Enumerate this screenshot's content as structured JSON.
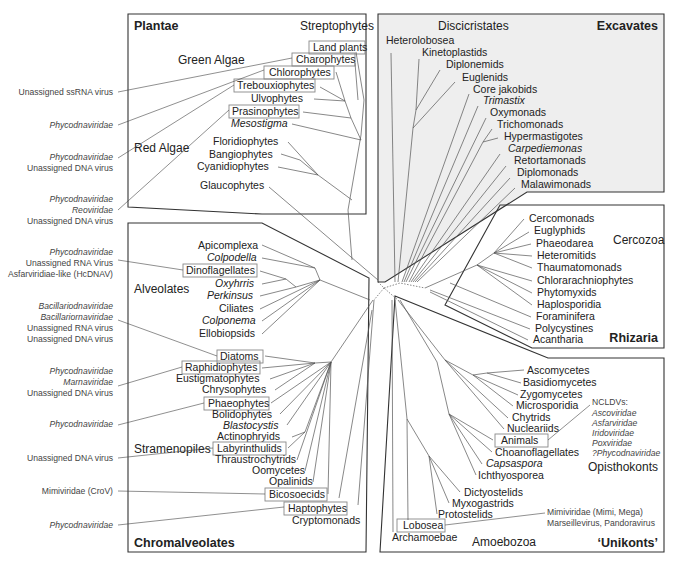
{
  "supergroups": {
    "plantae": "Plantae",
    "excavates": "Excavates",
    "rhizaria": "Rhizaria",
    "chromalveolates": "Chromalveolates",
    "unikonts": "‘Unikonts’"
  },
  "subgroups": {
    "streptophytes": "Streptophytes",
    "green_algae": "Green Algae",
    "red_algae": "Red Algae",
    "discicristates": "Discicristates",
    "cercozoa": "Cercozoa",
    "alveolates": "Alveolates",
    "stramenopiles": "Stramenopiles",
    "opisthokonts": "Opisthokonts",
    "amoebozoa": "Amoebozoa"
  },
  "plantae_taxa": [
    {
      "label": "Land plants",
      "boxed": true,
      "italic": false
    },
    {
      "label": "Charophytes",
      "boxed": true,
      "italic": false
    },
    {
      "label": "Chlorophytes",
      "boxed": true,
      "italic": false
    },
    {
      "label": "Trebouxiophytes",
      "boxed": true,
      "italic": false
    },
    {
      "label": "Ulvophytes",
      "boxed": false,
      "italic": false
    },
    {
      "label": "Prasinophytes",
      "boxed": true,
      "italic": false
    },
    {
      "label": "Mesostigma",
      "boxed": false,
      "italic": true
    },
    {
      "label": "Floridiophytes",
      "boxed": false,
      "italic": false
    },
    {
      "label": "Bangiophytes",
      "boxed": false,
      "italic": false
    },
    {
      "label": "Cyanidiophytes",
      "boxed": false,
      "italic": false
    },
    {
      "label": "Glaucophytes",
      "boxed": false,
      "italic": false
    }
  ],
  "excavates_taxa": [
    {
      "label": "Heterolobosea",
      "italic": false
    },
    {
      "label": "Kinetoplastids",
      "italic": false
    },
    {
      "label": "Diplonemids",
      "italic": false
    },
    {
      "label": "Euglenids",
      "italic": false
    },
    {
      "label": "Core jakobids",
      "italic": false
    },
    {
      "label": "Trimastix",
      "italic": true
    },
    {
      "label": "Oxymonads",
      "italic": false
    },
    {
      "label": "Trichomonads",
      "italic": false
    },
    {
      "label": "Hypermastigotes",
      "italic": false
    },
    {
      "label": "Carpediemonas",
      "italic": true
    },
    {
      "label": "Retortamonads",
      "italic": false
    },
    {
      "label": "Diplomonads",
      "italic": false
    },
    {
      "label": "Malawimonads",
      "italic": false
    }
  ],
  "rhizaria_taxa": [
    {
      "label": "Cercomonads"
    },
    {
      "label": "Euglyphids"
    },
    {
      "label": "Phaeodarea"
    },
    {
      "label": "Heteromitids"
    },
    {
      "label": "Thaumatomonads"
    },
    {
      "label": "Chlorarachniophytes"
    },
    {
      "label": "Phytomyxids"
    },
    {
      "label": "Haplosporidia"
    },
    {
      "label": "Foraminifera"
    },
    {
      "label": "Polycystines"
    },
    {
      "label": "Acantharia"
    }
  ],
  "chromalveolates_taxa": [
    {
      "label": "Apicomplexa",
      "boxed": false,
      "italic": false
    },
    {
      "label": "Colpodella",
      "boxed": false,
      "italic": true
    },
    {
      "label": "Dinoflagellates",
      "boxed": true,
      "italic": false
    },
    {
      "label": "Oxyhrris",
      "boxed": false,
      "italic": true
    },
    {
      "label": "Perkinsus",
      "boxed": false,
      "italic": true
    },
    {
      "label": "Ciliates",
      "boxed": false,
      "italic": false
    },
    {
      "label": "Colponema",
      "boxed": false,
      "italic": true
    },
    {
      "label": "Ellobiopsids",
      "boxed": false,
      "italic": false
    },
    {
      "label": "Diatoms",
      "boxed": true,
      "italic": false
    },
    {
      "label": "Raphidiophytes",
      "boxed": true,
      "italic": false
    },
    {
      "label": "Eustigmatophytes",
      "boxed": false,
      "italic": false
    },
    {
      "label": "Chrysophytes",
      "boxed": false,
      "italic": false
    },
    {
      "label": "Phaeophytes",
      "boxed": true,
      "italic": false
    },
    {
      "label": "Bolidophytes",
      "boxed": false,
      "italic": false
    },
    {
      "label": "Blastocystis",
      "boxed": false,
      "italic": true
    },
    {
      "label": "Actinophryids",
      "boxed": false,
      "italic": false
    },
    {
      "label": "Labyrinthulids",
      "boxed": true,
      "italic": false
    },
    {
      "label": "Thraustrochytrids",
      "boxed": false,
      "italic": false
    },
    {
      "label": "Oomycetes",
      "boxed": false,
      "italic": false
    },
    {
      "label": "Opalinids",
      "boxed": false,
      "italic": false
    },
    {
      "label": "Bicosoecids",
      "boxed": true,
      "italic": false
    },
    {
      "label": "Haptophytes",
      "boxed": true,
      "italic": false
    },
    {
      "label": "Cryptomonads",
      "boxed": false,
      "italic": false
    }
  ],
  "unikonts_taxa": [
    {
      "label": "Ascomycetes",
      "boxed": false,
      "italic": false
    },
    {
      "label": "Basidiomycetes",
      "boxed": false,
      "italic": false
    },
    {
      "label": "Zygomycetes",
      "boxed": false,
      "italic": false
    },
    {
      "label": "Microsporidia",
      "boxed": false,
      "italic": false
    },
    {
      "label": "Chytrids",
      "boxed": false,
      "italic": false
    },
    {
      "label": "Nucleariids",
      "boxed": false,
      "italic": false
    },
    {
      "label": "Animals",
      "boxed": true,
      "italic": false
    },
    {
      "label": "Choanoflagellates",
      "boxed": false,
      "italic": false
    },
    {
      "label": "Capsaspora",
      "boxed": false,
      "italic": true
    },
    {
      "label": "Ichthyosporea",
      "boxed": false,
      "italic": false
    },
    {
      "label": "Dictyostelids",
      "boxed": false,
      "italic": false
    },
    {
      "label": "Myxogastrids",
      "boxed": false,
      "italic": false
    },
    {
      "label": "Protostelids",
      "boxed": false,
      "italic": false
    },
    {
      "label": "Lobosea",
      "boxed": true,
      "italic": false
    },
    {
      "label": "Archamoebae",
      "boxed": false,
      "italic": false
    }
  ],
  "viruses_left": [
    {
      "lines": [
        {
          "text": "Unassigned ssRNA virus",
          "italic": false
        }
      ]
    },
    {
      "lines": [
        {
          "text": "Phycodnaviridae",
          "italic": true
        }
      ]
    },
    {
      "lines": [
        {
          "text": "Phycodnaviridae",
          "italic": true
        },
        {
          "text": "Unassigned DNA virus",
          "italic": false
        }
      ]
    },
    {
      "lines": [
        {
          "text": "Phycodnaviridae",
          "italic": true
        },
        {
          "text": "Reoviridae",
          "italic": true
        },
        {
          "text": "Unassigned DNA virus",
          "italic": false
        }
      ]
    },
    {
      "lines": [
        {
          "text": "Phycodnaviridae",
          "italic": true
        },
        {
          "text": "Unassigned RNA Virus",
          "italic": false
        },
        {
          "text": "Asfarviridiae-like (HcDNAV)",
          "italic": false
        }
      ]
    },
    {
      "lines": [
        {
          "text": "Bacillariodnaviridae",
          "italic": true
        },
        {
          "text": "Bacillariornaviridae",
          "italic": true
        },
        {
          "text": "Unassigned RNA virus",
          "italic": false
        },
        {
          "text": "Unassigned DNA virus",
          "italic": false
        }
      ]
    },
    {
      "lines": [
        {
          "text": "Phycodnaviridae",
          "italic": true
        },
        {
          "text": "Marnaviridae",
          "italic": true
        },
        {
          "text": "Unassigned DNA virus",
          "italic": false
        }
      ]
    },
    {
      "lines": [
        {
          "text": "Phycodnaviridae",
          "italic": true
        }
      ]
    },
    {
      "lines": [
        {
          "text": "Unassigned DNA virus",
          "italic": false
        }
      ]
    },
    {
      "lines": [
        {
          "text": "Mimiviridae (CroV)",
          "italic": false
        }
      ]
    },
    {
      "lines": [
        {
          "text": "Phycodnaviridae",
          "italic": true
        }
      ]
    }
  ],
  "viruses_right": {
    "nucldv_header": "NCLDVs:",
    "nucldv_list": [
      "Ascoviridae",
      "Asfarviridae",
      "Iridoviridae",
      "Poxviridae",
      "?Phycodnaviridae"
    ],
    "amoeba_viruses": [
      "Mimiviridae (Mimi, Mega)",
      "Marseillevirus, Pandoravirus"
    ]
  },
  "colors": {
    "excavates_fill": "#eeeeee",
    "panel_border": "#333333",
    "box_border": "#888888",
    "text": "#222222"
  }
}
